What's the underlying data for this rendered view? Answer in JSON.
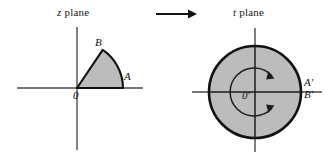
{
  "figure": {
    "background_color": "#ffffff",
    "stroke_color": "#111111",
    "fill_color": "#bcbcbc",
    "axis_color": "#4a4a4a",
    "width": 331,
    "height": 157
  },
  "left_panel": {
    "title_variable": "z",
    "title_suffix": " plane",
    "origin_label": "0",
    "point_a_label": "A",
    "point_b_label": "B",
    "shape": "circular-sector",
    "sector": {
      "center_x": 77,
      "center_y": 88,
      "radius": 46,
      "start_angle_deg": 0,
      "end_angle_deg": 56
    },
    "axes": {
      "x_start": 17,
      "x_end": 143,
      "y": 88,
      "y_start": 27,
      "y_end": 150,
      "x": 77
    }
  },
  "arrow": {
    "name": "mapping-arrow",
    "direction": "right",
    "x_start": 156,
    "x_end": 196,
    "y": 14
  },
  "right_panel": {
    "title_variable": "t",
    "title_suffix": " plane",
    "origin_label": "0'",
    "point_a_label": "A'",
    "point_b_label": "B'",
    "shape": "filled-disk",
    "disk": {
      "center_x": 255,
      "center_y": 92,
      "outer_radius": 47,
      "inner_arc_radius": 24
    },
    "rotation_arrow": {
      "label": "counterclockwise-sweep",
      "gap_side": "right"
    },
    "axes": {
      "x_start": 192,
      "x_end": 322,
      "y": 92,
      "y_start": 28,
      "y_end": 152,
      "x": 255
    }
  }
}
